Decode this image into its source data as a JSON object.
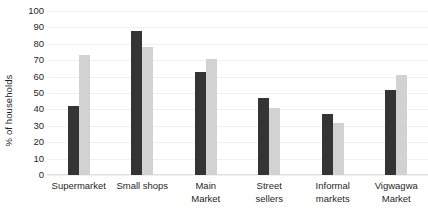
{
  "chart_data": {
    "type": "bar",
    "title": "",
    "subtitle": "",
    "xlabel": "",
    "ylabel": "% of households",
    "ylim": [
      0,
      100
    ],
    "yticks": [
      0,
      10,
      20,
      30,
      40,
      50,
      60,
      70,
      80,
      90,
      100
    ],
    "ytick_labels": [
      "0",
      "10",
      "20",
      "30",
      "40",
      "50",
      "60",
      "70",
      "80",
      "90",
      "100"
    ],
    "grid": true,
    "legend": null,
    "legend_position": "none",
    "categories": [
      "Supermarket",
      "Small shops",
      "Main Market",
      "Street sellers",
      "Informal markets",
      "Vigwagwa Market"
    ],
    "category_lines": [
      [
        "Supermarket"
      ],
      [
        "Small shops"
      ],
      [
        "Main",
        "Market"
      ],
      [
        "Street",
        "sellers"
      ],
      [
        "Informal",
        "markets"
      ],
      [
        "Vigwagwa",
        "Market"
      ]
    ],
    "series": [
      {
        "name": "series-1",
        "color": "#343434",
        "values": [
          42,
          88,
          63,
          47,
          37,
          52
        ]
      },
      {
        "name": "series-2",
        "color": "#d2d2d2",
        "values": [
          73,
          78,
          71,
          41,
          32,
          61
        ]
      }
    ]
  },
  "colors": {
    "dark_bar": "#343434",
    "light_bar": "#d2d2d2",
    "gridline": "#f0f0f0",
    "background": "#ffffff",
    "text": "#1f1f1f"
  }
}
